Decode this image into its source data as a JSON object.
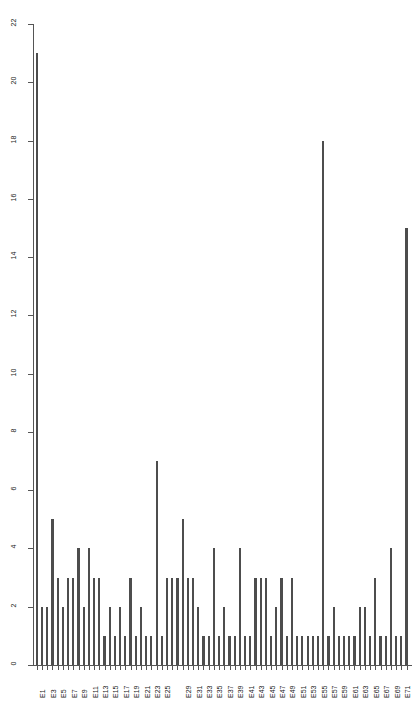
{
  "chart_data": {
    "type": "bar",
    "title": "",
    "subtitle": "",
    "xlabel": "",
    "ylabel": "",
    "grid": false,
    "legend": null,
    "bar_color": "#4d4d4d",
    "background_color": "#ffffff",
    "axis_color": "#555555",
    "ylim": [
      0,
      22
    ],
    "yticks": [
      0,
      2,
      4,
      6,
      8,
      10,
      12,
      14,
      16,
      18,
      20,
      22
    ],
    "ytick_labels": [
      "0",
      "2",
      "4",
      "6",
      "8",
      "10",
      "12",
      "14",
      "16",
      "18",
      "20",
      "22"
    ],
    "label_rotation_deg": 90,
    "categories": [
      "E1",
      "E2",
      "E3",
      "E4",
      "E5",
      "E6",
      "E7",
      "E8",
      "E9",
      "E10",
      "E11",
      "E12",
      "E13",
      "E14",
      "E15",
      "E16",
      "E17",
      "E18",
      "E19",
      "E20",
      "E21",
      "E22",
      "E23",
      "E24",
      "E25",
      "E26",
      "E27",
      "E28",
      "E29",
      "E30",
      "E31",
      "E32",
      "E33",
      "E34",
      "E35",
      "E36",
      "E37",
      "E38",
      "E39",
      "E40",
      "E41",
      "E42",
      "E43",
      "E44",
      "E45",
      "E46",
      "E47",
      "E48",
      "E49",
      "E50",
      "E51",
      "E52",
      "E53",
      "E54",
      "E55",
      "E56",
      "E57",
      "E58",
      "E59",
      "E60",
      "E61",
      "E62",
      "E63",
      "E64",
      "E65",
      "E66",
      "E67",
      "E68",
      "E69",
      "E70",
      "E71",
      "E72"
    ],
    "visible_tick_labels": [
      "E1",
      "E3",
      "E5",
      "E7",
      "E9",
      "E11",
      "E13",
      "E15",
      "E17",
      "E19",
      "E21",
      "E23",
      "E25",
      "E29",
      "E31",
      "E33",
      "E35",
      "E37",
      "E39",
      "E41",
      "E43",
      "E45",
      "E47",
      "E49",
      "E51",
      "E53",
      "E55",
      "E57",
      "E59",
      "E61",
      "E63",
      "E65",
      "E67",
      "E69",
      "E71"
    ],
    "values": [
      21,
      2,
      2,
      5,
      3,
      2,
      3,
      3,
      4,
      2,
      4,
      3,
      3,
      1,
      2,
      1,
      2,
      1,
      3,
      1,
      2,
      1,
      1,
      7,
      1,
      3,
      3,
      3,
      5,
      3,
      3,
      2,
      1,
      1,
      4,
      1,
      2,
      1,
      1,
      4,
      1,
      1,
      3,
      3,
      3,
      1,
      2,
      3,
      1,
      3,
      1,
      1,
      1,
      1,
      1,
      18,
      1,
      2,
      1,
      1,
      1,
      1,
      2,
      2,
      1,
      3,
      1,
      1,
      4,
      1,
      1,
      15
    ]
  }
}
